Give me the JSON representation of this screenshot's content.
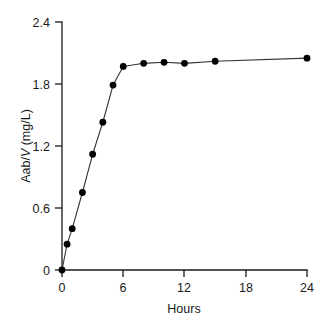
{
  "chart_data": {
    "type": "line",
    "title": "",
    "subtitle": "",
    "xlabel": "Hours",
    "ylabel": "Aab/V (mg/L)",
    "ylabel_parts": {
      "prefix": "Aab/",
      "italic": "V",
      "suffix": " (mg/L)"
    },
    "xlim": [
      0,
      24
    ],
    "ylim": [
      0,
      2.4
    ],
    "xticks": [
      0,
      6,
      12,
      18,
      24
    ],
    "xtick_labels": [
      "0",
      "6",
      "12",
      "18",
      "24"
    ],
    "yticks": [
      0,
      0.6,
      1.2,
      1.8,
      2.4
    ],
    "ytick_labels": [
      "0",
      "0.6",
      "1.2",
      "1.8",
      "2.4"
    ],
    "grid": false,
    "legend": null,
    "marker": "filled-circle",
    "marker_color": "#000000",
    "line_color": "#333333",
    "series": [
      {
        "name": "Aab/V",
        "x": [
          0,
          0.5,
          1,
          2,
          3,
          4,
          5,
          6,
          8,
          10,
          12,
          15,
          24
        ],
        "values": [
          0,
          0.25,
          0.4,
          0.75,
          1.12,
          1.43,
          1.79,
          1.97,
          2.0,
          2.01,
          2.0,
          2.02,
          2.05
        ]
      }
    ]
  },
  "figure": {
    "background_color": "#ffffff",
    "axis_color": "#1a1a1a"
  }
}
